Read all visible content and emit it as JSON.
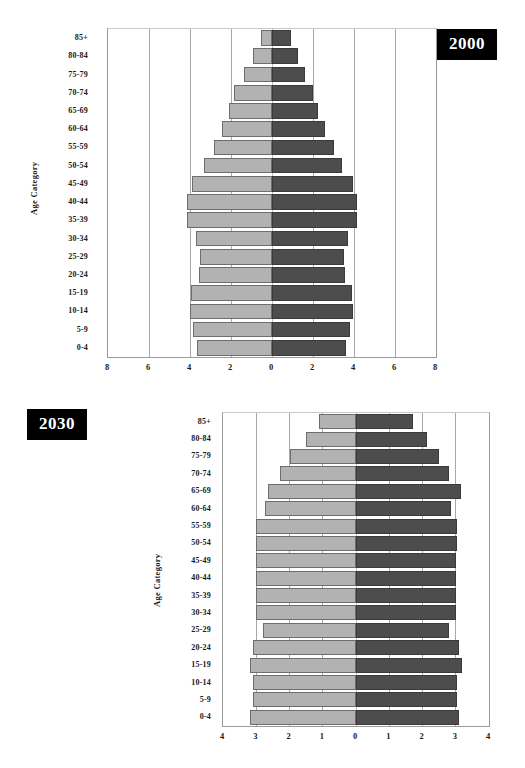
{
  "chart_data": [
    {
      "id": "pyramid-2000",
      "type": "bar",
      "orientation": "population-pyramid",
      "title": "2000",
      "xlabel": "",
      "ylabel": "Age Category",
      "xlim": [
        -8,
        8
      ],
      "xticks": [
        "8",
        "6",
        "4",
        "2",
        "0",
        "2",
        "4",
        "6",
        "8"
      ],
      "xtick_values": [
        -8,
        -6,
        -4,
        -2,
        0,
        2,
        4,
        6,
        8
      ],
      "grid": true,
      "legend": "none",
      "categories": [
        "85+",
        "80-84",
        "75-79",
        "70-74",
        "65-69",
        "60-64",
        "55-59",
        "50-54",
        "45-49",
        "40-44",
        "35-39",
        "30-34",
        "25-29",
        "20-24",
        "15-19",
        "10-14",
        "5-9",
        "0-4"
      ],
      "series": [
        {
          "name": "left",
          "values": [
            0.55,
            0.95,
            1.35,
            1.85,
            2.1,
            2.45,
            2.85,
            3.3,
            3.9,
            4.15,
            4.15,
            3.7,
            3.5,
            3.55,
            3.95,
            4.0,
            3.85,
            3.65
          ]
        },
        {
          "name": "right",
          "values": [
            0.95,
            1.25,
            1.6,
            2.0,
            2.25,
            2.6,
            3.0,
            3.4,
            3.95,
            4.15,
            4.15,
            3.7,
            3.5,
            3.55,
            3.9,
            3.95,
            3.8,
            3.6
          ]
        }
      ]
    },
    {
      "id": "pyramid-2030",
      "type": "bar",
      "orientation": "population-pyramid",
      "title": "2030",
      "xlabel": "",
      "ylabel": "Age Category",
      "xlim": [
        -4,
        4
      ],
      "xticks": [
        "4",
        "3",
        "2",
        "1",
        "0",
        "1",
        "2",
        "3",
        "4"
      ],
      "xtick_values": [
        -4,
        -3,
        -2,
        -1,
        0,
        1,
        2,
        3,
        4
      ],
      "grid": true,
      "legend": "none",
      "categories": [
        "85+",
        "80-84",
        "75-79",
        "70-74",
        "65-69",
        "60-64",
        "55-59",
        "50-54",
        "45-49",
        "40-44",
        "35-39",
        "30-34",
        "25-29",
        "20-24",
        "15-19",
        "10-14",
        "5-9",
        "0-4"
      ],
      "series": [
        {
          "name": "left",
          "values": [
            1.1,
            1.5,
            2.0,
            2.3,
            2.65,
            2.75,
            3.0,
            3.0,
            3.0,
            3.0,
            3.0,
            3.0,
            2.8,
            3.1,
            3.2,
            3.1,
            3.1,
            3.2
          ]
        },
        {
          "name": "right",
          "values": [
            1.7,
            2.15,
            2.5,
            2.8,
            3.15,
            2.85,
            3.05,
            3.05,
            3.0,
            3.0,
            3.0,
            3.0,
            2.8,
            3.1,
            3.2,
            3.05,
            3.05,
            3.1
          ]
        }
      ]
    }
  ],
  "charts": [
    {
      "year_label": "2000",
      "axis_title": "Age Category"
    },
    {
      "year_label": "2030",
      "axis_title": "Age Category"
    }
  ]
}
